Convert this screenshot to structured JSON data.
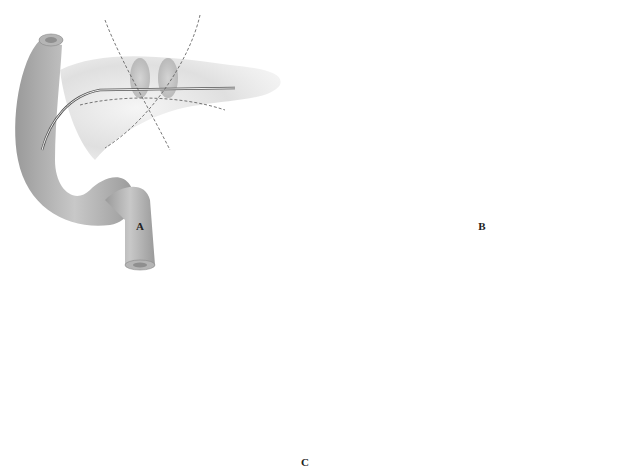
{
  "figure": {
    "panels": [
      {
        "id": "A",
        "label": "A",
        "description": "Pancreas transected with stent in duct; dashed sutures crossing"
      },
      {
        "id": "B",
        "label": "B",
        "description": "Sutures placed through both pancreatic stumps around stent"
      },
      {
        "id": "C",
        "label": "C",
        "description": "Completed anastomosis with tied sutures over stent"
      }
    ],
    "colors": {
      "organ_dark": "#8a8a8a",
      "organ_light": "#d9d9d9",
      "background": "#ffffff",
      "suture": "#555555"
    }
  }
}
